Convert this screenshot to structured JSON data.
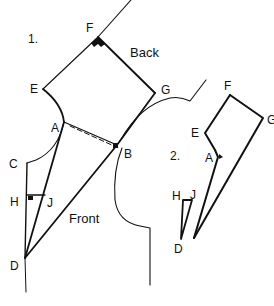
{
  "diagram": {
    "step1": {
      "number": "1.",
      "labels": {
        "F": "F",
        "E": "E",
        "G": "G",
        "A": "A",
        "B": "B",
        "C": "C",
        "H": "H",
        "J": "J",
        "D": "D"
      },
      "regions": {
        "back": "Back",
        "front": "Front"
      }
    },
    "step2": {
      "number": "2.",
      "labels": {
        "F": "F",
        "G": "G",
        "E": "E",
        "A": "A",
        "H": "H",
        "J": "J",
        "D": "D"
      }
    },
    "colors": {
      "line": "#111111",
      "background": "#ffffff"
    }
  }
}
